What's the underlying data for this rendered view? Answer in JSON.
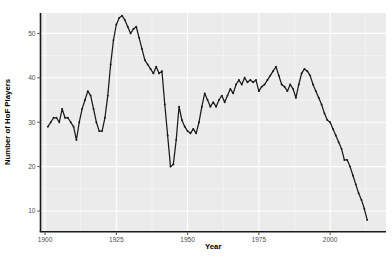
{
  "chart_data": {
    "type": "line",
    "title": "",
    "xlabel": "Year",
    "ylabel": "Number of HoF Players",
    "legend": "none",
    "grid": "major+minor",
    "x_ticks": [
      1900,
      1925,
      1950,
      1975,
      2000
    ],
    "y_ticks": [
      10,
      20,
      30,
      40,
      50
    ],
    "x_minor_ticks": [
      1912.5,
      1937.5,
      1962.5,
      1987.5,
      2012.5
    ],
    "y_minor_ticks": [
      15,
      25,
      35,
      45
    ],
    "xlim": [
      1898.4,
      2019.6
    ],
    "ylim": [
      5.5,
      54.6
    ],
    "panel_bg": "#EBEBEB",
    "grid_color": "#FFFFFF",
    "line_color": "#1A1A1A",
    "axis_line_color": "#1A1A1A",
    "tick_label_color": "#4D4D4D",
    "axis_title_color": "#000000",
    "x": [
      1901,
      1902,
      1903,
      1904,
      1905,
      1906,
      1907,
      1908,
      1909,
      1910,
      1911,
      1912,
      1913,
      1914,
      1915,
      1916,
      1917,
      1918,
      1919,
      1920,
      1921,
      1922,
      1923,
      1924,
      1925,
      1926,
      1927,
      1928,
      1929,
      1930,
      1931,
      1932,
      1933,
      1934,
      1935,
      1936,
      1937,
      1938,
      1939,
      1940,
      1941,
      1942,
      1943,
      1944,
      1945,
      1946,
      1947,
      1948,
      1949,
      1950,
      1951,
      1952,
      1953,
      1954,
      1955,
      1956,
      1957,
      1958,
      1959,
      1960,
      1961,
      1962,
      1963,
      1964,
      1965,
      1966,
      1967,
      1968,
      1969,
      1970,
      1971,
      1972,
      1973,
      1974,
      1975,
      1976,
      1977,
      1978,
      1979,
      1980,
      1981,
      1982,
      1983,
      1984,
      1985,
      1986,
      1987,
      1988,
      1989,
      1990,
      1991,
      1992,
      1993,
      1994,
      1995,
      1996,
      1997,
      1998,
      1999,
      2000,
      2001,
      2002,
      2003,
      2004,
      2005,
      2006,
      2007,
      2008,
      2009,
      2010,
      2011,
      2012,
      2013
    ],
    "values": [
      29,
      30,
      31,
      31,
      30,
      33,
      31,
      31,
      30,
      29,
      26,
      30,
      33,
      35,
      37,
      36,
      33,
      30,
      28,
      28,
      31,
      36,
      43,
      48.5,
      52,
      53.5,
      54,
      53,
      51.5,
      50,
      51,
      51.5,
      49,
      46.5,
      44,
      43,
      42,
      41,
      42.5,
      41,
      41.5,
      34,
      27,
      20,
      20.5,
      26,
      33.5,
      30.5,
      29,
      28,
      27.5,
      28.5,
      27.5,
      30,
      33.5,
      36.5,
      35,
      33.5,
      34.5,
      33.5,
      35,
      36,
      34.5,
      36,
      37.5,
      36.5,
      38.5,
      39.5,
      38.5,
      40,
      39,
      39.5,
      39,
      39.5,
      37,
      38,
      38.5,
      39.5,
      40.5,
      41.5,
      42.5,
      40.5,
      38.5,
      38,
      37,
      38.5,
      37.5,
      35.5,
      38.5,
      41,
      42,
      41.5,
      40.5,
      38.5,
      37,
      35.5,
      34,
      32,
      30.5,
      30,
      28.5,
      27,
      25.5,
      24,
      21.5,
      21.5,
      20,
      18,
      16,
      14,
      12.5,
      10.5,
      8
    ]
  }
}
